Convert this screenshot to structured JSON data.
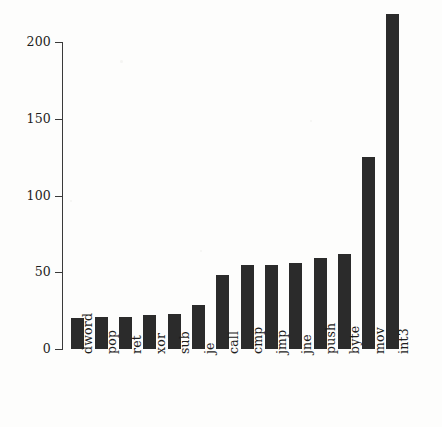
{
  "chart_data": {
    "type": "bar",
    "title": "",
    "subtitle": "",
    "xlabel": "",
    "ylabel": "",
    "categories": [
      "dword",
      "pop",
      "ret",
      "xor",
      "sub",
      "je",
      "call",
      "cmp",
      "jmp",
      "jne",
      "push",
      "byte",
      "mov",
      "int3"
    ],
    "values": [
      20,
      21,
      21,
      22,
      23,
      29,
      48,
      55,
      55,
      56,
      59,
      62,
      125,
      218
    ],
    "ylim": [
      0,
      225
    ],
    "yticks": [
      0,
      50,
      100,
      150,
      200
    ],
    "ytick_labels": [
      "0",
      "50",
      "100",
      "150",
      "200"
    ],
    "xtick_labels": [
      "dword",
      "pop",
      "ret",
      "xor",
      "sub",
      "je",
      "call",
      "cmp",
      "jmp",
      "jne",
      "push",
      "byte",
      "mov",
      "int3"
    ],
    "grid": false,
    "legend": null,
    "legend_position": "none",
    "bar_color": "#2b2b2b",
    "axis_color": "#3a3a3a",
    "background_color": "#fdfdfc",
    "annotations": [],
    "xlabel_rotation": -90
  }
}
